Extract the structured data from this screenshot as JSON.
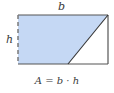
{
  "diagram": {
    "labels": {
      "base": "b",
      "height": "h"
    },
    "formula": "A = b · h",
    "colors": {
      "fill": "#c5d8f4",
      "outline": "#555555",
      "dashed_edge": "#7a7a7a",
      "text": "#3a3a3a"
    }
  }
}
